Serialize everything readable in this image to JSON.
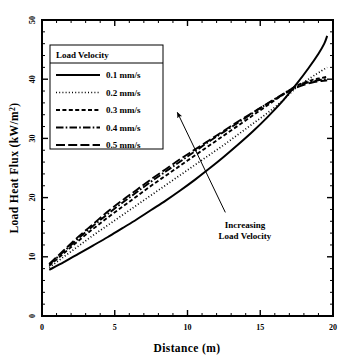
{
  "chart_data": {
    "type": "line",
    "title": "",
    "subtitle": "",
    "xlabel": "Distance (m)",
    "ylabel": "Load Heat Flux (kW/m²)",
    "ylabel_base": "Load Heat Flux (kW/m",
    "ylabel_sup": "2",
    "ylabel_close": ")",
    "xlim": [
      0,
      20
    ],
    "ylim": [
      0,
      50
    ],
    "xticks": [
      0,
      5,
      10,
      15,
      20
    ],
    "yticks": [
      0,
      10,
      20,
      30,
      40,
      50
    ],
    "xtick_labels": [
      "0",
      "5",
      "10",
      "15",
      "20"
    ],
    "ytick_labels": [
      "0",
      "10",
      "20",
      "30",
      "40",
      "50"
    ],
    "x_minor_step": 1,
    "y_minor_step": 2,
    "grid": false,
    "frame": true,
    "legend_position": "upper-left",
    "legend_title": "Load Velocity",
    "series": [
      {
        "name": "0.1 mm/s",
        "label": "0.1 mm/s",
        "style": "solid",
        "dash": "none",
        "color": "#000000",
        "x": [
          0.5,
          1.5,
          2.5,
          3.5,
          4.5,
          5.5,
          6.5,
          7.5,
          8.5,
          9.5,
          10.5,
          11.5,
          12.5,
          13.5,
          14.5,
          15.5,
          16.5,
          17.5,
          18.3,
          19.0,
          19.4,
          19.6
        ],
        "values": [
          7.8,
          9.1,
          10.5,
          11.9,
          13.3,
          14.8,
          16.3,
          17.9,
          19.5,
          21.2,
          23.0,
          24.9,
          26.9,
          29.0,
          31.2,
          33.6,
          36.2,
          39.2,
          41.8,
          44.3,
          46.0,
          47.3
        ]
      },
      {
        "name": "0.2 mm/s",
        "label": "0.2 mm/s",
        "style": "dotted",
        "dash": "1,2",
        "color": "#000000",
        "x": [
          0.5,
          1.5,
          2.5,
          3.5,
          4.5,
          5.5,
          6.5,
          7.5,
          8.5,
          9.5,
          10.5,
          11.5,
          12.5,
          13.5,
          14.5,
          15.5,
          16.5,
          17.5,
          18.5,
          19.2,
          19.6
        ],
        "values": [
          8.2,
          10.0,
          11.8,
          13.6,
          15.3,
          17.0,
          18.7,
          20.4,
          22.1,
          23.8,
          25.5,
          27.2,
          28.9,
          30.7,
          32.5,
          34.3,
          36.3,
          38.6,
          40.3,
          41.4,
          42.0
        ]
      },
      {
        "name": "0.3 mm/s",
        "label": "0.3 mm/s",
        "style": "dashed",
        "dash": "4,2.5",
        "color": "#000000",
        "x": [
          0.5,
          1.5,
          2.5,
          3.5,
          4.5,
          5.5,
          6.5,
          7.5,
          8.5,
          9.5,
          10.5,
          11.5,
          12.5,
          13.5,
          14.5,
          15.5,
          16.5,
          17.5,
          18.5,
          19.2,
          19.6
        ],
        "values": [
          8.5,
          10.6,
          12.7,
          14.7,
          16.6,
          18.4,
          20.2,
          22.0,
          23.7,
          25.4,
          27.1,
          28.8,
          30.5,
          32.2,
          33.9,
          35.6,
          37.3,
          38.9,
          39.8,
          40.2,
          40.4
        ]
      },
      {
        "name": "0.4 mm/s",
        "label": "0.4 mm/s",
        "style": "dashdot",
        "dash": "7,2,1.5,2",
        "color": "#000000",
        "x": [
          0.5,
          1.5,
          2.5,
          3.5,
          4.5,
          5.5,
          6.5,
          7.5,
          8.5,
          9.5,
          10.5,
          11.5,
          12.5,
          13.5,
          14.5,
          15.5,
          16.5,
          17.5,
          18.5,
          19.2,
          19.6
        ],
        "values": [
          8.7,
          10.9,
          13.1,
          15.2,
          17.2,
          19.1,
          20.9,
          22.7,
          24.4,
          26.1,
          27.8,
          29.5,
          31.1,
          32.7,
          34.3,
          35.9,
          37.4,
          38.8,
          39.6,
          39.9,
          40.0
        ]
      },
      {
        "name": "0.5 mm/s",
        "label": "0.5 mm/s",
        "style": "longdash",
        "dash": "9,3",
        "color": "#000000",
        "x": [
          0.5,
          1.5,
          2.5,
          3.5,
          4.5,
          5.5,
          6.5,
          7.5,
          8.5,
          9.5,
          10.5,
          11.5,
          12.5,
          13.5,
          14.5,
          15.5,
          16.5,
          17.5,
          18.5,
          19.2,
          19.6
        ],
        "values": [
          8.8,
          11.1,
          13.4,
          15.5,
          17.6,
          19.5,
          21.3,
          23.1,
          24.8,
          26.5,
          28.1,
          29.7,
          31.3,
          32.9,
          34.4,
          35.9,
          37.3,
          38.6,
          39.4,
          39.7,
          39.8
        ]
      }
    ],
    "annotations": [
      {
        "text_line1": "Increasing",
        "text_line2": "Load Velocity",
        "arrow_from_x": 12.6,
        "arrow_from_y": 17.5,
        "arrow_to_x": 9.3,
        "arrow_to_y": 34.4
      }
    ]
  },
  "legend": {
    "title": "Load Velocity",
    "entries": [
      {
        "label": "0.1 mm/s",
        "style": "solid"
      },
      {
        "label": "0.2 mm/s",
        "style": "dotted"
      },
      {
        "label": "0.3 mm/s",
        "style": "dashed"
      },
      {
        "label": "0.4 mm/s",
        "style": "dashdot"
      },
      {
        "label": "0.5 mm/s",
        "style": "longdash"
      }
    ]
  },
  "colors": {
    "line": "#000000",
    "frame": "#000000",
    "background": "#ffffff",
    "text": "#000000"
  }
}
